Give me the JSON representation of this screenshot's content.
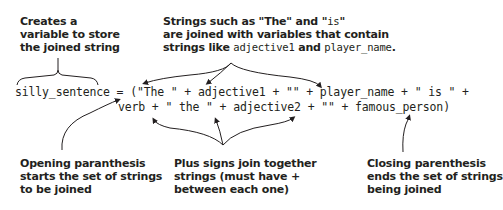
{
  "diagram": {
    "type": "annotated-code",
    "colors": {
      "text": "#231f20",
      "arrow": "#231f20",
      "background": "#ffffff"
    },
    "code": {
      "line1": "silly_sentence = (\"The \" + adjective1 + \"\" + player_name + \" is \" +",
      "line2": "verb + \" the \" + adjective2 + \"\" + famous_person)"
    },
    "annotations": {
      "top_left": {
        "lines": [
          "Creates a",
          "variable to store",
          "the joined string"
        ],
        "points_to": "silly_sentence"
      },
      "top_center": {
        "line1": "Strings such as \"The\" and \"is\"",
        "line1_parts": [
          "Strings such as \"The\" and \"",
          "is",
          "\""
        ],
        "line2": "are joined with variables that contain",
        "line3_parts": [
          "strings like ",
          "adjective1",
          " and ",
          "player_name",
          "."
        ],
        "points_to": [
          "\"The \"",
          "adjective1",
          "player_name"
        ]
      },
      "bottom_left": {
        "lines": [
          "Opening paranthesis",
          "starts the set of strings",
          "to be joined"
        ],
        "points_to": "("
      },
      "bottom_center": {
        "lines": [
          "Plus signs join together",
          "strings (must have +",
          "between each one)"
        ],
        "points_to": [
          "+",
          "+",
          "+"
        ]
      },
      "bottom_right": {
        "lines": [
          "Closing parenthesis",
          "ends the set of strings",
          "being joined"
        ],
        "points_to": ")"
      }
    }
  }
}
